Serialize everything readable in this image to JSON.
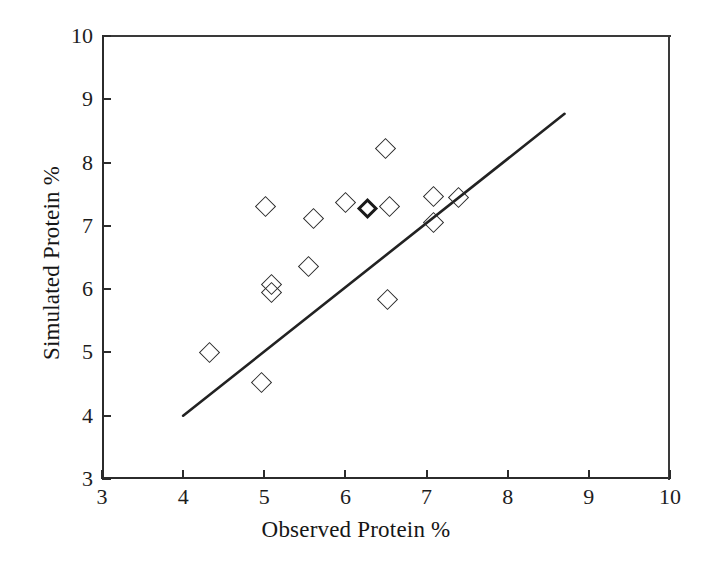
{
  "chart_data": {
    "type": "scatter",
    "title": "",
    "xlabel": "Observed Protein %",
    "ylabel": "Simulated Protein %",
    "xlim": [
      3,
      10
    ],
    "ylim": [
      3,
      10
    ],
    "xticks": [
      3,
      4,
      5,
      6,
      7,
      8,
      9,
      10
    ],
    "yticks": [
      3,
      4,
      5,
      6,
      7,
      8,
      9,
      10
    ],
    "xtick_labels": [
      "3",
      "4",
      "5",
      "6",
      "7",
      "8",
      "9",
      "10"
    ],
    "ytick_labels": [
      "3",
      "4",
      "5",
      "6",
      "7",
      "8",
      "9",
      "10"
    ],
    "grid": false,
    "legend": false,
    "marker": "open-diamond",
    "marker_color": "#2c2c2c",
    "line_color": "#222222",
    "points": [
      {
        "x": 4.32,
        "y": 5.0,
        "overlap": false
      },
      {
        "x": 4.97,
        "y": 4.53,
        "overlap": false
      },
      {
        "x": 5.01,
        "y": 7.3,
        "overlap": false
      },
      {
        "x": 5.09,
        "y": 6.08,
        "overlap": false
      },
      {
        "x": 5.09,
        "y": 5.94,
        "overlap": false
      },
      {
        "x": 5.55,
        "y": 6.35,
        "overlap": false
      },
      {
        "x": 5.61,
        "y": 7.12,
        "overlap": false
      },
      {
        "x": 6.0,
        "y": 7.37,
        "overlap": false
      },
      {
        "x": 6.27,
        "y": 7.27,
        "overlap": true
      },
      {
        "x": 6.49,
        "y": 8.22,
        "overlap": false
      },
      {
        "x": 6.54,
        "y": 7.3,
        "overlap": false
      },
      {
        "x": 6.52,
        "y": 5.83,
        "overlap": false
      },
      {
        "x": 7.08,
        "y": 7.47,
        "overlap": false
      },
      {
        "x": 7.09,
        "y": 7.05,
        "overlap": false
      },
      {
        "x": 7.39,
        "y": 7.45,
        "overlap": false
      }
    ],
    "trend_line": {
      "x0": 4.0,
      "y0": 4.0,
      "x1": 8.7,
      "y1": 8.77
    }
  }
}
